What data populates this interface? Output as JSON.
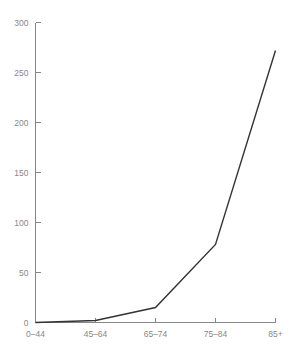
{
  "chart_data": {
    "type": "line",
    "title": "",
    "subtitle": "",
    "xlabel": "",
    "ylabel": "",
    "categories": [
      "0–44",
      "45–64",
      "65–74",
      "75–84",
      "85+"
    ],
    "series": [
      {
        "name": "rate",
        "values": [
          0,
          2,
          15,
          78,
          272
        ]
      }
    ],
    "ylim": [
      0,
      300
    ],
    "yticks": [
      0,
      50,
      100,
      150,
      200,
      250,
      300
    ],
    "ytick_labels": [
      "0",
      "50",
      "100",
      "150",
      "200",
      "250",
      "300"
    ],
    "xtick_labels": [
      "0–44",
      "45–64",
      "65–74",
      "75–84",
      "85+"
    ],
    "grid": false,
    "legend": false,
    "legend_position": "none",
    "annotations": [],
    "colors": {
      "line": "#333333",
      "axis": "#888888",
      "tick_text": "#888888",
      "background": "#ffffff"
    }
  }
}
